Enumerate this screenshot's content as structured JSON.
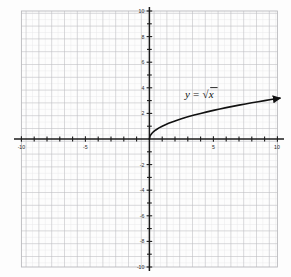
{
  "figure": {
    "background_color": "#fdfdfd",
    "paper_color": "#ffffff"
  },
  "chart_data": {
    "type": "line",
    "title": "",
    "subtitle": "",
    "xlabel": "",
    "ylabel": "",
    "xlim": [
      -10,
      10
    ],
    "ylim": [
      -10,
      10
    ],
    "grid": true,
    "grid_major_step": 1,
    "grid_minor_step": 0.5,
    "legend_position": "none",
    "annotations": [
      {
        "name": "equation-label",
        "text": "y = √x",
        "text_y": "y",
        "text_equals": "=",
        "text_radical": "√",
        "text_x": "x",
        "x": 3.2,
        "y": 3.5
      }
    ],
    "series": [
      {
        "name": "y = sqrt(x)",
        "color": "#111111",
        "line_width": 1.6,
        "arrow_end": true,
        "domain": [
          0,
          10.2
        ],
        "x": [
          0,
          0.05,
          0.1,
          0.2,
          0.3,
          0.5,
          0.75,
          1,
          1.5,
          2,
          2.5,
          3,
          3.5,
          4,
          4.5,
          5,
          5.5,
          6,
          6.5,
          7,
          7.5,
          8,
          8.5,
          9,
          9.5,
          10,
          10.2
        ],
        "y": [
          0,
          0.224,
          0.316,
          0.447,
          0.548,
          0.707,
          0.866,
          1,
          1.225,
          1.414,
          1.581,
          1.732,
          1.871,
          2,
          2.121,
          2.236,
          2.345,
          2.449,
          2.55,
          2.646,
          2.739,
          2.828,
          2.915,
          3,
          3.082,
          3.162,
          3.194
        ]
      }
    ],
    "x_axis": {
      "name": "x-axis",
      "tick_values": [
        -10,
        -5,
        5,
        10
      ],
      "tick_labels": [
        "-10",
        "-5",
        "5",
        "10"
      ],
      "minor_tick_step": 1,
      "color": "#1b1b1b"
    },
    "y_axis": {
      "name": "y-axis",
      "tick_values": [
        10,
        8,
        6,
        4,
        2,
        -2,
        -4,
        -6,
        -8,
        -10
      ],
      "tick_labels": [
        "10",
        "8",
        "6",
        "4",
        "2",
        "-2",
        "-4",
        "-6",
        "-8",
        "-10"
      ],
      "minor_tick_step": 1,
      "color": "#1b1b1b"
    },
    "colors": {
      "curve": "#111111",
      "axis": "#1b1b1b",
      "grid_major": "#b8b8bc",
      "grid_minor": "#dfdfe2",
      "text": "#2a2a2a"
    }
  }
}
